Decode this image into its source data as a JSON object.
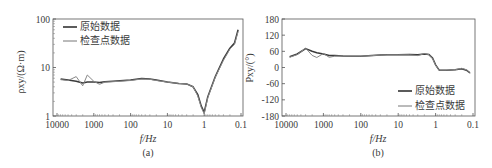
{
  "panels": [
    {
      "id": "a",
      "caption": "(a)",
      "xlabel": "f/Hz",
      "ylabel": "ρxy/(Ω·m)",
      "yticks": [
        "100",
        "10",
        "1"
      ],
      "xticks": [
        "10000",
        "1000",
        "100",
        "10",
        "1",
        "0.1"
      ],
      "legend": [
        "原始数据",
        "检查点数据"
      ]
    },
    {
      "id": "b",
      "caption": "(b)",
      "xlabel": "f/Hz",
      "ylabel": "Pxy/(°)",
      "yticks": [
        "180",
        "120",
        "60",
        "0",
        "-60",
        "-120",
        "-180"
      ],
      "xticks": [
        "10000",
        "1000",
        "100",
        "10",
        "1",
        "0.1"
      ],
      "legend": [
        "原始数据",
        "检查点数据"
      ]
    }
  ],
  "chart_data": [
    {
      "type": "line",
      "title": "(a)",
      "xlabel": "f/Hz",
      "ylabel": "ρxy/(Ω·m)",
      "xscale": "log-reversed",
      "yscale": "log",
      "xlim": [
        10000,
        0.1
      ],
      "ylim": [
        1,
        100
      ],
      "legend_position": "upper-left",
      "x": [
        8000,
        5000,
        3000,
        2000,
        1500,
        1000,
        700,
        500,
        300,
        100,
        50,
        30,
        20,
        10,
        5,
        3,
        2,
        1.5,
        1.2,
        1.0,
        0.8,
        0.5,
        0.3,
        0.2,
        0.15,
        0.12
      ],
      "series": [
        {
          "name": "原始数据",
          "values": [
            5.8,
            5.5,
            5.2,
            4.8,
            5.0,
            5.0,
            4.9,
            5.1,
            5.2,
            5.5,
            5.9,
            5.8,
            5.5,
            5.0,
            4.7,
            4.6,
            4.0,
            2.8,
            1.6,
            1.2,
            2.5,
            6.5,
            15,
            25,
            32,
            60
          ]
        },
        {
          "name": "检查点数据",
          "values": [
            5.6,
            5.4,
            6.5,
            4.2,
            7.0,
            5.2,
            4.5,
            5.0,
            5.1,
            5.4,
            5.8,
            5.7,
            5.4,
            5.0,
            4.7,
            4.6,
            4.0,
            2.6,
            1.5,
            1.1,
            2.4,
            6.3,
            14,
            24,
            30,
            55
          ]
        }
      ]
    },
    {
      "type": "line",
      "title": "(b)",
      "xlabel": "f/Hz",
      "ylabel": "Pxy/(°)",
      "xscale": "log-reversed",
      "yscale": "linear",
      "xlim": [
        10000,
        0.1
      ],
      "ylim": [
        -180,
        180
      ],
      "legend_position": "lower-right",
      "x": [
        8000,
        5000,
        3000,
        2000,
        1500,
        1000,
        700,
        500,
        300,
        100,
        50,
        30,
        20,
        10,
        5,
        3,
        2,
        1.5,
        1.2,
        1.0,
        0.8,
        0.5,
        0.3,
        0.2,
        0.15,
        0.12
      ],
      "series": [
        {
          "name": "原始数据",
          "values": [
            40,
            50,
            70,
            60,
            55,
            50,
            45,
            45,
            43,
            42,
            44,
            46,
            47,
            47,
            48,
            47,
            50,
            48,
            35,
            10,
            -10,
            -10,
            -8,
            -5,
            -10,
            -20
          ]
        },
        {
          "name": "检查点数据",
          "values": [
            38,
            48,
            72,
            45,
            37,
            52,
            38,
            42,
            43,
            42,
            44,
            46,
            47,
            47,
            47,
            44,
            52,
            48,
            33,
            8,
            -10,
            -10,
            -8,
            -3,
            -8,
            -22
          ]
        }
      ]
    }
  ]
}
